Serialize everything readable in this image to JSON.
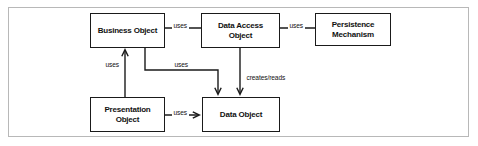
{
  "figure": {
    "type": "dao-pattern-diagram",
    "frame_color": "#b8b8b8",
    "background": "#ffffff",
    "line_color": "#1a1a1a"
  },
  "nodes": [
    {
      "id": "business-object",
      "label": "Business Object",
      "x": 90,
      "y": 13,
      "w": 75,
      "h": 35
    },
    {
      "id": "data-access-object",
      "label": "Data Access\nObject",
      "x": 201,
      "y": 13,
      "w": 79,
      "h": 35
    },
    {
      "id": "persistence-mechanism",
      "label": "Persistence\nMechanism",
      "x": 315,
      "y": 13,
      "w": 76,
      "h": 33
    },
    {
      "id": "presentation-object",
      "label": "Presentation\nObject",
      "x": 90,
      "y": 97,
      "w": 75,
      "h": 35
    },
    {
      "id": "data-object",
      "label": "Data Object",
      "x": 202,
      "y": 97,
      "w": 78,
      "h": 35
    }
  ],
  "edges": [
    {
      "id": "business-to-dao",
      "from": "business-object",
      "to": "data-access-object",
      "label": "uses",
      "label_x": 176,
      "label_y": 27
    },
    {
      "id": "dao-to-persistence",
      "from": "data-access-object",
      "to": "persistence-mechanism",
      "label": "uses",
      "label_x": 291,
      "label_y": 27
    },
    {
      "id": "presentation-to-business",
      "from": "presentation-object",
      "to": "business-object",
      "label": "uses",
      "label_x": 106,
      "label_y": 66
    },
    {
      "id": "business-to-data-object",
      "from": "business-object",
      "to": "data-object",
      "label": "uses",
      "label_x": 176,
      "label_y": 66
    },
    {
      "id": "dao-to-data-object",
      "from": "data-access-object",
      "to": "data-object",
      "label": "creates/reads",
      "label_x": 245,
      "label_y": 80
    },
    {
      "id": "presentation-to-data-object",
      "from": "presentation-object",
      "to": "data-object",
      "label": "uses",
      "label_x": 174,
      "label_y": 110
    }
  ]
}
